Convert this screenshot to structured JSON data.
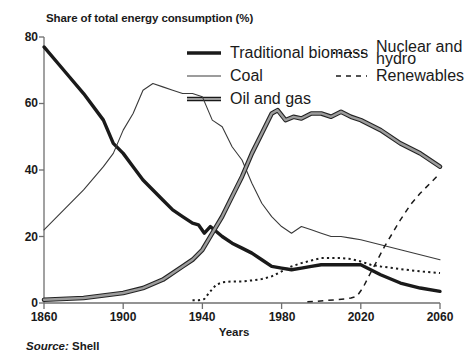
{
  "chart_data": {
    "type": "line",
    "title": "Share of total energy consumption (%)",
    "xlabel": "Years",
    "ylabel": "",
    "source": "Source: Shell",
    "source_word": "Source:",
    "source_value": "Shell",
    "xlim": [
      1860,
      2060
    ],
    "ylim": [
      0,
      80
    ],
    "xticks": [
      1860,
      1900,
      1940,
      1980,
      2020,
      2060
    ],
    "yticks": [
      0,
      20,
      40,
      60,
      80
    ],
    "grid": false,
    "legend_position": "top-right",
    "series": [
      {
        "name": "Traditional biomass",
        "style": "solid-thick",
        "color": "#1a1a1a",
        "x": [
          1860,
          1870,
          1880,
          1890,
          1895,
          1900,
          1905,
          1910,
          1915,
          1920,
          1925,
          1930,
          1935,
          1938,
          1941,
          1944,
          1947,
          1950,
          1955,
          1960,
          1965,
          1970,
          1975,
          1980,
          1985,
          1990,
          1995,
          2000,
          2005,
          2010,
          2015,
          2020,
          2025,
          2030,
          2040,
          2050,
          2060
        ],
        "y": [
          77,
          70,
          63,
          55,
          48,
          45,
          41,
          37,
          34,
          31,
          28,
          26,
          24,
          23.5,
          21,
          23,
          21.5,
          20,
          18,
          16.5,
          15,
          13,
          11,
          10.5,
          10,
          10.5,
          11,
          11.5,
          11.5,
          11.5,
          11.5,
          11.5,
          10,
          8.5,
          6,
          4.5,
          3.5
        ]
      },
      {
        "name": "Coal",
        "style": "solid-thin",
        "color": "#3a3a3a",
        "x": [
          1860,
          1870,
          1880,
          1890,
          1895,
          1900,
          1905,
          1910,
          1915,
          1920,
          1925,
          1930,
          1935,
          1940,
          1945,
          1950,
          1955,
          1960,
          1965,
          1970,
          1975,
          1980,
          1985,
          1990,
          1995,
          2000,
          2005,
          2010,
          2015,
          2020,
          2030,
          2040,
          2050,
          2060
        ],
        "y": [
          22,
          28,
          34,
          41,
          45,
          52,
          57,
          64,
          66,
          65,
          64,
          63,
          63,
          62,
          55,
          53,
          47,
          43,
          36,
          30,
          26,
          23,
          21,
          23,
          22,
          21,
          20,
          20,
          19.5,
          19,
          17.5,
          16,
          14.5,
          13
        ]
      },
      {
        "name": "Oil and gas",
        "style": "solid-double",
        "color": "#6b6b6b",
        "x": [
          1860,
          1880,
          1900,
          1910,
          1920,
          1930,
          1935,
          1940,
          1945,
          1950,
          1955,
          1960,
          1965,
          1970,
          1975,
          1978,
          1982,
          1986,
          1990,
          1995,
          2000,
          2005,
          2010,
          2015,
          2020,
          2030,
          2040,
          2050,
          2060
        ],
        "y": [
          1,
          1.5,
          3,
          4.5,
          7,
          11,
          13,
          16,
          21,
          26,
          32,
          38,
          45,
          51,
          57,
          58,
          55,
          56,
          55.5,
          57,
          57,
          56,
          57.5,
          56,
          55,
          52,
          48,
          45,
          41
        ]
      },
      {
        "name": "Nuclear and hydro",
        "style": "dotted",
        "color": "#1a1a1a",
        "x": [
          1935,
          1938,
          1941,
          1944,
          1947,
          1950,
          1955,
          1960,
          1965,
          1970,
          1975,
          1980,
          1985,
          1990,
          1995,
          2000,
          2005,
          2010,
          2015,
          2020,
          2025,
          2030,
          2040,
          2050,
          2060
        ],
        "y": [
          0.8,
          0.8,
          1.2,
          3.5,
          5.5,
          6.2,
          6.5,
          6.5,
          6.8,
          7.2,
          8,
          9.5,
          11,
          12,
          12.8,
          13.5,
          13.5,
          13.5,
          13.2,
          12.5,
          11.5,
          11,
          10.2,
          9.5,
          9
        ]
      },
      {
        "name": "Renewables",
        "style": "dashed",
        "color": "#1a1a1a",
        "x": [
          1993,
          1998,
          2003,
          2008,
          2012,
          2015,
          2018,
          2021,
          2024,
          2028,
          2032,
          2036,
          2040,
          2045,
          2050,
          2055,
          2060
        ],
        "y": [
          0.4,
          0.5,
          0.8,
          1.0,
          1.2,
          1.5,
          2.0,
          4.5,
          8,
          12.5,
          17,
          21,
          25,
          29.5,
          33,
          36,
          39
        ]
      }
    ]
  },
  "axis": {
    "yticks": [
      "0",
      "20",
      "40",
      "60",
      "80"
    ],
    "xticks": [
      "1860",
      "1900",
      "1940",
      "1980",
      "2020",
      "2060"
    ],
    "xtitle": "Years"
  },
  "legend": {
    "items": [
      {
        "label": "Traditional biomass",
        "sample": "solid-thick-sample"
      },
      {
        "label": "Coal",
        "sample": "solid-thin-sample"
      },
      {
        "label": "Oil and gas",
        "sample": "solid-double-sample"
      },
      {
        "label": "Nuclear and hydro",
        "sample": "dotted-sample"
      },
      {
        "label": "Renewables",
        "sample": "dashed-sample"
      }
    ]
  }
}
